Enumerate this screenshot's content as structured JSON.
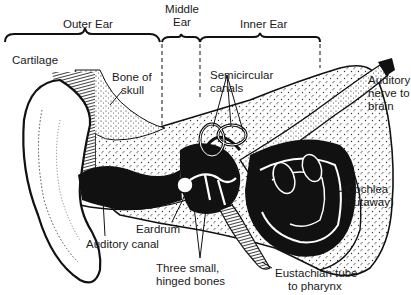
{
  "diagram": {
    "sections": [
      {
        "id": "outer",
        "label": "Outer Ear"
      },
      {
        "id": "middle",
        "label_line1": "Middle",
        "label_line2": "Ear"
      },
      {
        "id": "inner",
        "label": "Inner Ear"
      }
    ],
    "labels": {
      "cartilage": "Cartilage",
      "bone_of_skull_1": "Bone of",
      "bone_of_skull_2": "skull",
      "semicircular_1": "Semicircular",
      "semicircular_2": "canals",
      "auditory_nerve_1": "Auditory",
      "auditory_nerve_2": "nerve to",
      "auditory_nerve_3": "brain",
      "cochlea_1": "Cochlea",
      "cochlea_2": "(cutaway)",
      "eardrum": "Eardrum",
      "auditory_canal": "Auditory canal",
      "three_bones_1": "Three small,",
      "three_bones_2": "hinged bones",
      "eustachian_1": "Eustachian tube",
      "eustachian_2": "to pharynx"
    },
    "colors": {
      "ink": "#111111",
      "background": "#ffffff",
      "stipple": "#555555"
    }
  }
}
